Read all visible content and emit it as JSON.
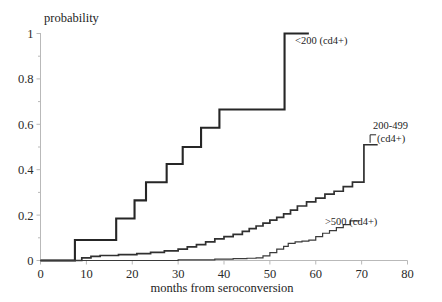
{
  "chart_data": {
    "type": "line",
    "title": "",
    "subtitle": "",
    "xlabel": "months from seroconversion",
    "ylabel": "probability",
    "xlim": [
      0,
      80
    ],
    "ylim": [
      0,
      1
    ],
    "xticks": [
      0,
      10,
      20,
      30,
      40,
      50,
      60,
      70,
      80
    ],
    "xtick_labels": [
      "0",
      "10",
      "20",
      "30",
      "40",
      "50",
      "60",
      "70",
      "80"
    ],
    "yticks": [
      0,
      0.2,
      0.4,
      0.6,
      0.8,
      1
    ],
    "ytick_labels": [
      "0",
      "0.2",
      "0.4",
      "0.6",
      "0.8",
      "1"
    ],
    "yminor_ticks": [
      0.1,
      0.3,
      0.5,
      0.7,
      0.9
    ],
    "grid": false,
    "legend_position": "inline-annotations",
    "step_type": "post",
    "series": [
      {
        "name": "<200 (cd4+)",
        "label": "<200 (cd4+)",
        "label_x": 55.5,
        "label_y": 0.97,
        "x": [
          0,
          5,
          7.5,
          7.5,
          16.5,
          16.5,
          20.5,
          20.5,
          23,
          23,
          27.5,
          27.5,
          31,
          31,
          35,
          35,
          39,
          39,
          44.5,
          44.5,
          53.2,
          53.2,
          58.5
        ],
        "y": [
          0,
          0,
          0,
          0.09,
          0.09,
          0.185,
          0.185,
          0.265,
          0.265,
          0.345,
          0.345,
          0.425,
          0.425,
          0.5,
          0.5,
          0.585,
          0.585,
          0.665,
          0.665,
          0.665,
          0.665,
          1.0,
          1.0
        ]
      },
      {
        "name": "200-499 (cd4+)",
        "label_line1": "200-499",
        "label_line2": "(cd4+)",
        "label_x": 72.5,
        "label_y": 0.58,
        "x": [
          0,
          6,
          9,
          11,
          13,
          17,
          21,
          24,
          27,
          30,
          32,
          34,
          36,
          38,
          40,
          42,
          44,
          45.5,
          47,
          48.5,
          50,
          51.5,
          53,
          54.5,
          56,
          58,
          60,
          62,
          64,
          66,
          68,
          70.5,
          70.5,
          73.5
        ],
        "y": [
          0,
          0,
          0.012,
          0.018,
          0.022,
          0.026,
          0.03,
          0.036,
          0.042,
          0.05,
          0.06,
          0.07,
          0.082,
          0.095,
          0.105,
          0.115,
          0.128,
          0.14,
          0.152,
          0.165,
          0.178,
          0.19,
          0.205,
          0.222,
          0.24,
          0.258,
          0.275,
          0.292,
          0.305,
          0.325,
          0.345,
          0.345,
          0.51,
          0.51
        ]
      },
      {
        "name": ">500 (cd4+)",
        "label": ">500 (cd4+)",
        "label_x": 62.0,
        "label_y": 0.175,
        "x": [
          0,
          20,
          30,
          38,
          42,
          45,
          47,
          48.5,
          50,
          51.5,
          53,
          54,
          55.5,
          57,
          58.5,
          60,
          61.5,
          63,
          64.5,
          66,
          67.5,
          69.5
        ],
        "y": [
          0,
          0,
          0.003,
          0.006,
          0.008,
          0.01,
          0.012,
          0.02,
          0.035,
          0.05,
          0.062,
          0.075,
          0.082,
          0.085,
          0.09,
          0.105,
          0.12,
          0.132,
          0.145,
          0.158,
          0.175,
          0.175
        ]
      }
    ]
  },
  "axis": {
    "y_title": "probability",
    "x_title": "months from seroconversion"
  }
}
